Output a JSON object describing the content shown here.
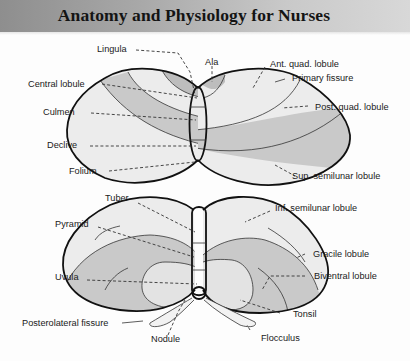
{
  "header": {
    "title": "Anatomy and Physiology for Nurses"
  },
  "colors": {
    "light_lobe": "#ececec",
    "mid_lobe": "#c9c9c9",
    "outline": "#111111",
    "header_band_dark": "#8e8e8e",
    "header_band_light": "#d8d8d8"
  },
  "diagram": {
    "top_view": {
      "labels_left": [
        "Lingula",
        "Central lobule",
        "Culmen",
        "Declive",
        "Folium"
      ],
      "labels_center": [
        "Ala"
      ],
      "labels_right": [
        "Ant. quad. lobule",
        "Primary fissure",
        "Post. quad. lobule",
        "Sup. semilunar lobule"
      ]
    },
    "bottom_view": {
      "labels_left": [
        "Tuber",
        "Pyramid",
        "Uvula",
        "Posterolateral fissure"
      ],
      "labels_center": [
        "Nodule"
      ],
      "labels_right": [
        "Inf. semilunar lobule",
        "Gracile lobule",
        "Biventral lobule",
        "Tonsil",
        "Flocculus"
      ]
    }
  }
}
